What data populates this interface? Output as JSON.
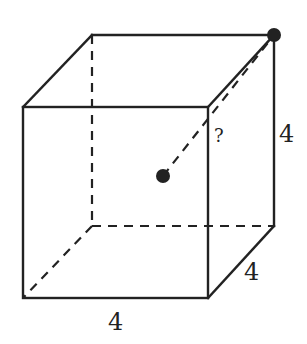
{
  "diagram": {
    "type": "cube-geometry",
    "labels": {
      "front_width": "4",
      "depth": "4",
      "height": "4",
      "unknown_distance": "?"
    },
    "points": [
      {
        "name": "cube-center",
        "description": "point at center of cube"
      },
      {
        "name": "top-back-right-vertex",
        "description": "marked corner vertex"
      }
    ],
    "colors": {
      "line": "#222222",
      "background": "#ffffff"
    }
  }
}
